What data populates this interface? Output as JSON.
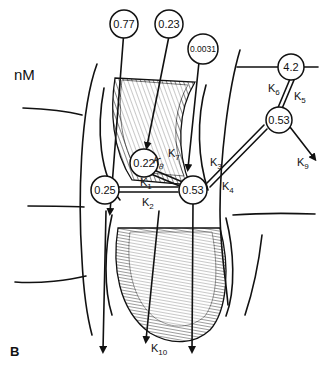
{
  "figure": {
    "panel_label": "B",
    "unit_label": "nM",
    "nodes": [
      {
        "id": "source1",
        "value": "0.77"
      },
      {
        "id": "source2",
        "value": "0.23"
      },
      {
        "id": "source3",
        "value": "0.0031"
      },
      {
        "id": "upper_channel",
        "value": "0.22"
      },
      {
        "id": "left_hub",
        "value": "0.25"
      },
      {
        "id": "central_hub",
        "value": "0.53"
      },
      {
        "id": "right_hub",
        "value": "0.53"
      },
      {
        "id": "top_right",
        "value": "4.2"
      }
    ],
    "rate_constants": [
      {
        "id": "K1",
        "base": "K",
        "sub": "1"
      },
      {
        "id": "K2",
        "base": "K",
        "sub": "2"
      },
      {
        "id": "K3",
        "base": "K",
        "sub": "3"
      },
      {
        "id": "K4",
        "base": "K",
        "sub": "4"
      },
      {
        "id": "K5",
        "base": "K",
        "sub": "5"
      },
      {
        "id": "K6",
        "base": "K",
        "sub": "6"
      },
      {
        "id": "K7",
        "base": "K",
        "sub": "7"
      },
      {
        "id": "K8",
        "base": "K",
        "sub": "8"
      },
      {
        "id": "K9",
        "base": "K",
        "sub": "9"
      },
      {
        "id": "K10",
        "base": "K",
        "sub": "10"
      }
    ]
  }
}
